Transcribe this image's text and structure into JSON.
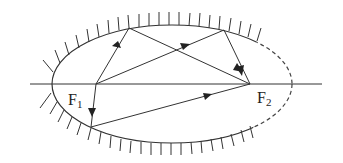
{
  "diagram": {
    "title": "",
    "labels": {
      "f1": "F",
      "f1_sub": "1",
      "f2": "F",
      "f2_sub": "2"
    },
    "colors": {
      "stroke": "#333333",
      "background": "#ffffff"
    },
    "ellipse": {
      "cx": 172,
      "cy": 84,
      "rx": 120,
      "ry": 59
    },
    "foci": [
      {
        "name": "F1",
        "x": 96,
        "y": 84
      },
      {
        "name": "F2",
        "x": 250,
        "y": 84
      }
    ],
    "rays": [
      {
        "from": "F1",
        "via": [
          129,
          28
        ],
        "to": "F2"
      },
      {
        "from": "F1",
        "via": [
          224,
          30
        ],
        "to": "F2"
      },
      {
        "from": "F1",
        "via": [
          91,
          127
        ],
        "to": "F2"
      }
    ]
  }
}
